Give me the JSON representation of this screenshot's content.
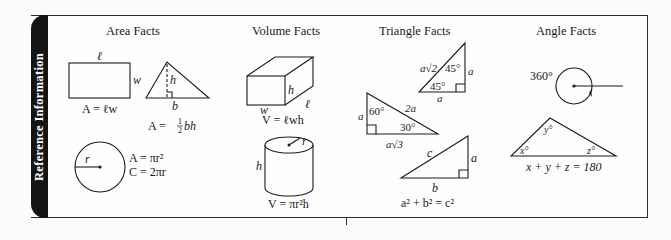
{
  "sidebar": {
    "label": "Reference Information"
  },
  "sections": [
    {
      "heading": "Area Facts",
      "figures": [
        {
          "shape": "rectangle",
          "labels": {
            "top": "ℓ",
            "side": "w"
          },
          "formula": "A = ℓw"
        },
        {
          "shape": "triangle",
          "labels": {
            "height": "h",
            "base": "b"
          },
          "formula": "A = ½ bh",
          "formula_parts": {
            "lhs": "A = ",
            "num": "1",
            "den": "2",
            "rhs": " bh"
          }
        },
        {
          "shape": "circle",
          "labels": {
            "radius": "r"
          },
          "formulas": [
            "A = πr²",
            "C = 2πr"
          ]
        }
      ]
    },
    {
      "heading": "Volume Facts",
      "figures": [
        {
          "shape": "rectangular-prism",
          "labels": {
            "height": "h",
            "width": "w",
            "length": "ℓ"
          },
          "formula": "V = ℓwh"
        },
        {
          "shape": "cylinder",
          "labels": {
            "radius": "r",
            "height": "h"
          },
          "formula": "V = πr²h"
        }
      ]
    },
    {
      "heading": "Triangle Facts",
      "figures": [
        {
          "shape": "45-45-90-triangle",
          "labels": {
            "hypotenuse": "a√2",
            "leg_vertical": "a",
            "leg_horizontal": "a",
            "angle_top": "45°",
            "angle_bottom": "45°"
          }
        },
        {
          "shape": "30-60-90-triangle",
          "labels": {
            "short_leg": "a",
            "hypotenuse": "2a",
            "long_leg": "a√3",
            "angle_top": "60°",
            "angle_bottom": "30°"
          }
        },
        {
          "shape": "right-triangle",
          "labels": {
            "hypotenuse": "c",
            "leg_vertical": "a",
            "leg_horizontal": "b"
          },
          "formula": "a² + b² = c²"
        }
      ]
    },
    {
      "heading": "Angle Facts",
      "figures": [
        {
          "shape": "full-rotation",
          "labels": {
            "angle": "360°"
          }
        },
        {
          "shape": "triangle-angle-sum",
          "labels": {
            "angle_x": "x°",
            "angle_y": "y°",
            "angle_z": "z°"
          },
          "formula": "x + y + z = 180"
        }
      ]
    }
  ],
  "colors": {
    "ink": "#1a1a1a",
    "tab": "#141414",
    "paper": "#fefefe"
  }
}
